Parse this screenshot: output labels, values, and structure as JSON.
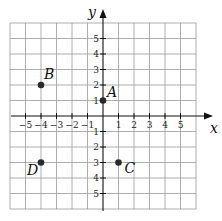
{
  "chart_data": {
    "type": "scatter",
    "title": "",
    "xlabel": "x",
    "ylabel": "y",
    "xlim": [
      -6,
      6
    ],
    "ylim": [
      -6,
      6
    ],
    "grid": true,
    "x_ticks": [
      -5,
      -4,
      -3,
      -2,
      -1,
      1,
      2,
      3,
      4,
      5
    ],
    "y_ticks": [
      5,
      4,
      3,
      2,
      1,
      -1,
      -2,
      -3,
      -4,
      -5
    ],
    "x_tick_labels": [
      "−5",
      "−4",
      "−3",
      "−2",
      "−1",
      "1",
      "2",
      "3",
      "4",
      "5"
    ],
    "y_tick_labels": [
      "5",
      "4",
      "3",
      "2",
      "1",
      "1",
      "2",
      "3",
      "4",
      "5"
    ],
    "points": [
      {
        "label": "A",
        "x": 0,
        "y": 1
      },
      {
        "label": "B",
        "x": -4,
        "y": 2
      },
      {
        "label": "C",
        "x": 1,
        "y": -3
      },
      {
        "label": "D",
        "x": -4,
        "y": -3
      }
    ]
  },
  "axes": {
    "x_label": "x",
    "y_label": "y"
  },
  "points": {
    "a": "A",
    "b": "B",
    "c": "C",
    "d": "D"
  }
}
